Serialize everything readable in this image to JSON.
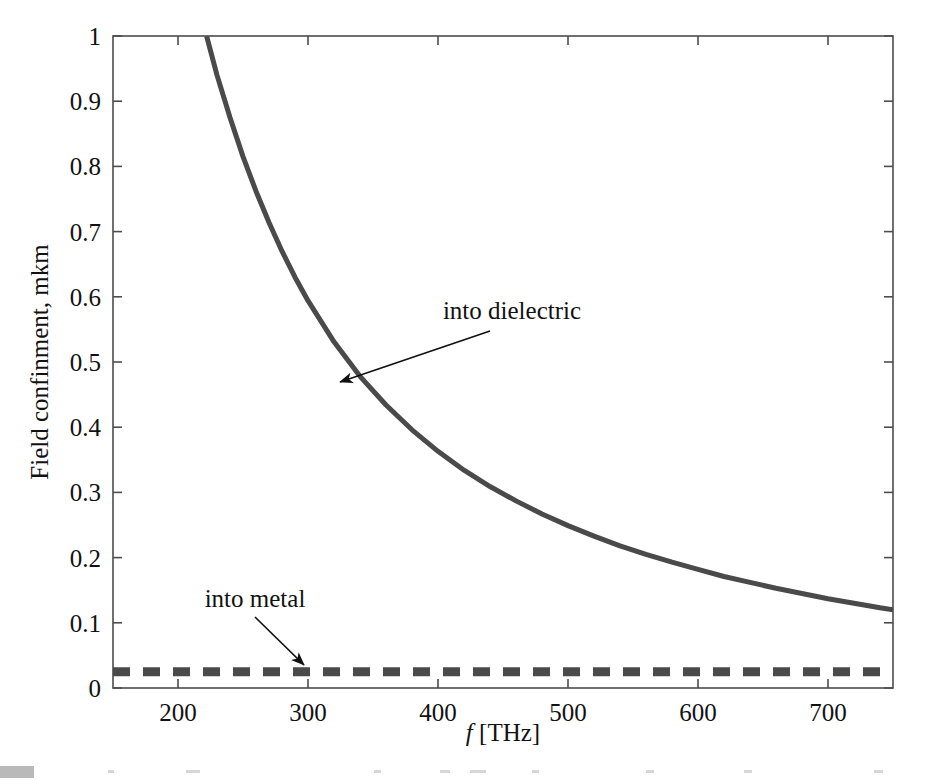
{
  "figure": {
    "background": "#ffffff",
    "plot_box": {
      "left": 113,
      "top": 36,
      "right": 893,
      "bottom": 688
    }
  },
  "chart_data": {
    "type": "line",
    "title": "",
    "xlabel": "f [THz]",
    "xlabel_italic_part": "f",
    "xlabel_rest": " [THz]",
    "ylabel": "Field confinment, mkm",
    "xlim": [
      150,
      750
    ],
    "ylim": [
      0,
      1
    ],
    "xticks": [
      200,
      300,
      400,
      500,
      600,
      700
    ],
    "xticklabels": [
      "200",
      "300",
      "400",
      "500",
      "600",
      "700"
    ],
    "yticks": [
      0,
      0.1,
      0.2,
      0.3,
      0.4,
      0.5,
      0.6,
      0.7,
      0.8,
      0.9,
      1
    ],
    "yticklabels": [
      "0",
      "0.1",
      "0.2",
      "0.3",
      "0.4",
      "0.5",
      "0.6",
      "0.7",
      "0.8",
      "0.9",
      "1"
    ],
    "grid": false,
    "legend": "none",
    "series": [
      {
        "name": "into dielectric",
        "style": "solid",
        "color": "#4a4a4a",
        "linewidth": 5,
        "x": [
          222,
          230,
          240,
          250,
          260,
          270,
          280,
          290,
          300,
          320,
          340,
          360,
          380,
          400,
          420,
          440,
          460,
          480,
          500,
          520,
          540,
          560,
          580,
          600,
          620,
          640,
          660,
          680,
          700,
          720,
          740,
          750
        ],
        "y": [
          1.0,
          0.94,
          0.875,
          0.815,
          0.762,
          0.714,
          0.67,
          0.63,
          0.594,
          0.531,
          0.478,
          0.434,
          0.396,
          0.363,
          0.334,
          0.309,
          0.287,
          0.267,
          0.249,
          0.233,
          0.218,
          0.205,
          0.193,
          0.182,
          0.171,
          0.162,
          0.153,
          0.145,
          0.137,
          0.13,
          0.123,
          0.12
        ]
      },
      {
        "name": "into metal",
        "style": "dashed",
        "color": "#4a4a4a",
        "linewidth": 9,
        "dash": "17 13",
        "x": [
          150,
          750
        ],
        "y": [
          0.025,
          0.025
        ]
      }
    ],
    "annotations": [
      {
        "text": "into dielectric",
        "text_x": 512,
        "text_y": 319,
        "arrow_from_x": 490,
        "arrow_from_y": 331,
        "arrow_to_x": 340,
        "arrow_to_y": 382
      },
      {
        "text": "into metal",
        "text_x": 255,
        "text_y": 607,
        "arrow_from_x": 255,
        "arrow_from_y": 617,
        "arrow_to_x": 304,
        "arrow_to_y": 665
      }
    ]
  }
}
